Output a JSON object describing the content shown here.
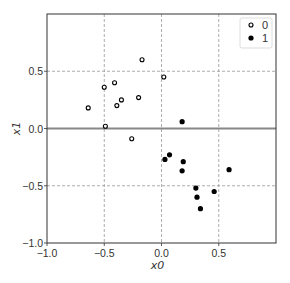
{
  "chart_data": {
    "type": "scatter",
    "title": "",
    "xlabel": "x0",
    "ylabel": "x1",
    "xlim": [
      -1.0,
      1.0
    ],
    "ylim": [
      -1.0,
      1.0
    ],
    "x_ticks": [
      -1.0,
      -0.5,
      0.0,
      0.5
    ],
    "y_ticks": [
      -1.0,
      -0.5,
      0.0,
      0.5
    ],
    "x_tick_labels": [
      "−1.0",
      "−0.5",
      "0.0",
      "0.5"
    ],
    "y_tick_labels": [
      "−1.0",
      "−0.5",
      "0.0",
      "0.5"
    ],
    "grid": true,
    "grid_style": "dashed",
    "hline": 0.0,
    "legend_position": "upper right",
    "series": [
      {
        "name": "0",
        "marker": "open-circle",
        "color": "#000000",
        "points": [
          [
            -0.64,
            0.18
          ],
          [
            -0.5,
            0.36
          ],
          [
            -0.41,
            0.4
          ],
          [
            -0.39,
            0.2
          ],
          [
            -0.35,
            0.25
          ],
          [
            -0.2,
            0.27
          ],
          [
            -0.17,
            0.6
          ],
          [
            0.02,
            0.45
          ],
          [
            -0.49,
            0.02
          ],
          [
            -0.26,
            -0.09
          ]
        ]
      },
      {
        "name": "1",
        "marker": "filled-circle",
        "color": "#000000",
        "points": [
          [
            0.18,
            0.06
          ],
          [
            0.07,
            -0.23
          ],
          [
            0.03,
            -0.27
          ],
          [
            0.19,
            -0.29
          ],
          [
            0.18,
            -0.37
          ],
          [
            0.59,
            -0.36
          ],
          [
            0.3,
            -0.52
          ],
          [
            0.46,
            -0.55
          ],
          [
            0.31,
            -0.6
          ],
          [
            0.34,
            -0.7
          ]
        ]
      }
    ]
  },
  "colors": {
    "axes": "#333333",
    "grid": "#999999",
    "hline": "#888888",
    "legend_border": "#dddddd"
  }
}
